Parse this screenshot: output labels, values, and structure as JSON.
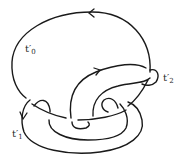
{
  "diagram": {
    "type": "knot-diagram",
    "stroke_color": "#1a1a1a",
    "background": "#ffffff",
    "labels": [
      {
        "id": "t0",
        "base": "t′",
        "sub": "0"
      },
      {
        "id": "t1",
        "base": "t′",
        "sub": "1"
      },
      {
        "id": "t2",
        "base": "t′",
        "sub": "2"
      }
    ],
    "arrows": [
      {
        "on": "outer-top-arc",
        "direction": "left"
      },
      {
        "on": "inner-upper-arc",
        "direction": "right-up"
      },
      {
        "on": "left-lower-loop",
        "direction": "down"
      }
    ]
  }
}
